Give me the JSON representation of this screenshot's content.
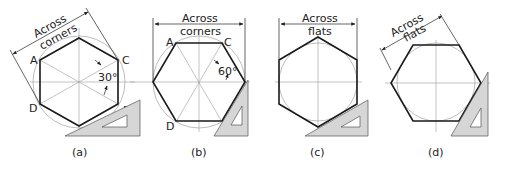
{
  "figure": {
    "panels": [
      {
        "id": "a",
        "caption": "(a)",
        "dimension_label_line1": "Across",
        "dimension_label_line2": "corners",
        "vertices": {
          "A": "A",
          "B": "B",
          "C": "C",
          "D": "D"
        },
        "angle": "30°"
      },
      {
        "id": "b",
        "caption": "(b)",
        "dimension_label_line1": "Across",
        "dimension_label_line2": "corners",
        "vertices": {
          "A": "A",
          "B": "B",
          "C": "C",
          "D": "D"
        },
        "angle": "60°"
      },
      {
        "id": "c",
        "caption": "(c)",
        "dimension_label_line1": "Across",
        "dimension_label_line2": "flats"
      },
      {
        "id": "d",
        "caption": "(d)",
        "dimension_label_line1": "Across",
        "dimension_label_line2": "flats"
      }
    ],
    "colors": {
      "outline": "#1a1a1a",
      "construction": "#b5b5b5",
      "triangle_fill": "#d6d6d6"
    }
  }
}
